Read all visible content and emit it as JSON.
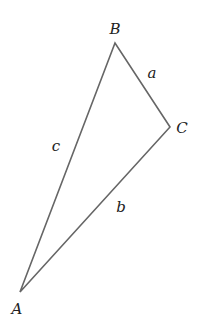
{
  "diagram": {
    "type": "triangle",
    "vertices": [
      {
        "name": "A",
        "x": 20,
        "y": 292,
        "label_x": 17,
        "label_y": 314
      },
      {
        "name": "B",
        "x": 115,
        "y": 43,
        "label_x": 115,
        "label_y": 34
      },
      {
        "name": "C",
        "x": 170,
        "y": 127,
        "label_x": 182,
        "label_y": 133
      }
    ],
    "sides": [
      {
        "name": "a",
        "from": "B",
        "to": "C",
        "label_x": 152,
        "label_y": 78
      },
      {
        "name": "b",
        "from": "A",
        "to": "C",
        "label_x": 121,
        "label_y": 212
      },
      {
        "name": "c",
        "from": "A",
        "to": "B",
        "label_x": 56,
        "label_y": 151
      }
    ],
    "stroke_color": "#666666",
    "label_color": "#222222"
  }
}
